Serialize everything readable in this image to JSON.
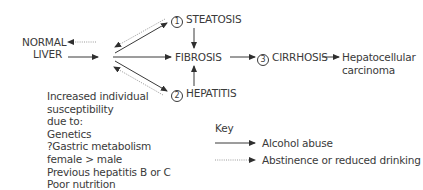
{
  "diagram": {
    "nodes": {
      "normal_liver": {
        "line1": "NORMAL",
        "line2": "LIVER"
      },
      "steatosis": {
        "number": "1",
        "label": "STEATOSIS"
      },
      "fibrosis": {
        "label": "FIBROSIS"
      },
      "hepatitis": {
        "number": "2",
        "label": "HEPATITIS"
      },
      "cirrhosis": {
        "number": "3",
        "label": "CIRRHOSIS"
      },
      "hcc": {
        "line1": "Hepatocellular",
        "line2": "carcinoma"
      }
    },
    "risk_factors": {
      "lines": [
        "Increased individual",
        "susceptibility",
        "due to:",
        "Genetics",
        "?Gastric metabolism",
        "female > male",
        "Previous hepatitis B or C",
        "Poor nutrition"
      ]
    },
    "key": {
      "title": "Key",
      "items": [
        {
          "style": "solid",
          "label": "Alcohol abuse"
        },
        {
          "style": "dotted",
          "label": "Abstinence or reduced drinking"
        }
      ]
    },
    "colors": {
      "line": "#3a3a3a",
      "dotted": "#9a9a9a",
      "text": "#3a3a3a"
    }
  }
}
